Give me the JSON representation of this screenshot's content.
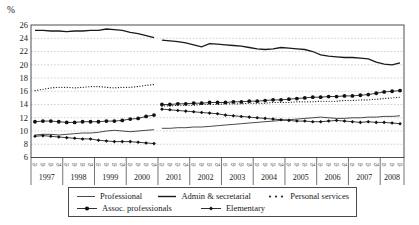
{
  "chart_data": {
    "type": "line",
    "title": "",
    "ylabel": "%",
    "xlabel": "",
    "ylim": [
      6,
      26
    ],
    "ytick_step": 2,
    "grid": "horizontal-dashed",
    "legend_position": "bottom-box",
    "x_axis": {
      "quarter_labels": [
        "Q1",
        "Q2",
        "Q3",
        "Q4"
      ],
      "years": [
        {
          "label": "1997",
          "quarters": 4
        },
        {
          "label": "1998",
          "quarters": 4
        },
        {
          "label": "1999",
          "quarters": 4
        },
        {
          "label": "2000",
          "quarters": 4
        },
        {
          "label": "2001",
          "quarters": 4
        },
        {
          "label": "2002",
          "quarters": 4
        },
        {
          "label": "2003",
          "quarters": 4
        },
        {
          "label": "2004",
          "quarters": 4
        },
        {
          "label": "2005",
          "quarters": 4
        },
        {
          "label": "2006",
          "quarters": 4
        },
        {
          "label": "2007",
          "quarters": 4
        },
        {
          "label": "2008",
          "quarters": 3
        }
      ],
      "series_break_after_index": 15
    },
    "series": [
      {
        "name": "Professional",
        "style": "thin-line",
        "marker": "none",
        "values": [
          9.4,
          9.5,
          9.5,
          9.4,
          9.5,
          9.6,
          9.7,
          9.7,
          9.8,
          10.0,
          10.1,
          10.0,
          9.9,
          10.0,
          10.1,
          10.2,
          10.4,
          10.4,
          10.5,
          10.5,
          10.6,
          10.6,
          10.7,
          10.8,
          10.9,
          11.0,
          11.1,
          11.2,
          11.3,
          11.4,
          11.5,
          11.6,
          11.7,
          11.8,
          11.9,
          12.0,
          12.1,
          12.0,
          11.9,
          11.9,
          12.0,
          12.0,
          12.1,
          12.1,
          12.2,
          12.2,
          12.3
        ]
      },
      {
        "name": "Admin & secretarial",
        "style": "solid-line",
        "marker": "none",
        "values": [
          25.2,
          25.2,
          25.1,
          25.1,
          25.0,
          25.1,
          25.1,
          25.2,
          25.2,
          25.4,
          25.3,
          25.2,
          24.9,
          24.7,
          24.4,
          24.1,
          23.7,
          23.6,
          23.5,
          23.3,
          23.0,
          22.7,
          23.2,
          23.1,
          23.0,
          22.9,
          22.8,
          22.6,
          22.4,
          22.3,
          22.4,
          22.6,
          22.5,
          22.4,
          22.3,
          22.0,
          21.5,
          21.3,
          21.2,
          21.1,
          21.1,
          21.0,
          20.9,
          20.4,
          20.1,
          20.0,
          20.3
        ]
      },
      {
        "name": "Personal services",
        "style": "dotted-line",
        "marker": "none",
        "values": [
          16.1,
          16.3,
          16.5,
          16.6,
          16.6,
          16.5,
          16.6,
          16.7,
          16.7,
          16.6,
          16.5,
          16.6,
          16.6,
          16.7,
          16.9,
          17.0,
          13.8,
          13.8,
          13.9,
          13.9,
          13.9,
          14.0,
          14.0,
          14.0,
          14.1,
          14.1,
          14.1,
          14.2,
          14.2,
          14.2,
          14.3,
          14.3,
          14.3,
          14.4,
          14.4,
          14.4,
          14.5,
          14.5,
          14.5,
          14.6,
          14.6,
          14.7,
          14.7,
          14.8,
          14.9,
          15.0,
          15.1
        ]
      },
      {
        "name": "Assoc. professionals",
        "style": "solid-line-markers",
        "marker": "circle",
        "values": [
          11.4,
          11.5,
          11.5,
          11.4,
          11.3,
          11.3,
          11.4,
          11.4,
          11.4,
          11.5,
          11.5,
          11.6,
          11.8,
          11.9,
          12.2,
          12.4,
          14.0,
          14.0,
          14.1,
          14.1,
          14.2,
          14.2,
          14.3,
          14.3,
          14.3,
          14.4,
          14.4,
          14.5,
          14.5,
          14.6,
          14.7,
          14.7,
          14.8,
          14.9,
          15.0,
          15.1,
          15.1,
          15.2,
          15.2,
          15.3,
          15.3,
          15.4,
          15.5,
          15.7,
          15.9,
          16.0,
          16.1
        ]
      },
      {
        "name": "Elementary",
        "style": "solid-line-markers",
        "marker": "diamond",
        "values": [
          9.2,
          9.3,
          9.2,
          9.1,
          9.0,
          8.9,
          8.8,
          8.8,
          8.6,
          8.5,
          8.4,
          8.4,
          8.4,
          8.3,
          8.2,
          8.1,
          13.3,
          13.2,
          13.1,
          13.0,
          12.9,
          12.8,
          12.7,
          12.6,
          12.4,
          12.3,
          12.2,
          12.1,
          12.0,
          11.9,
          11.8,
          11.7,
          11.6,
          11.5,
          11.5,
          11.4,
          11.4,
          11.5,
          11.6,
          11.5,
          11.4,
          11.3,
          11.4,
          11.3,
          11.3,
          11.2,
          11.1
        ]
      }
    ],
    "colors": {
      "line": "#1a1a1a",
      "grid": "#bdbdbd",
      "text": "#1a1a1a",
      "background": "#ffffff"
    }
  }
}
